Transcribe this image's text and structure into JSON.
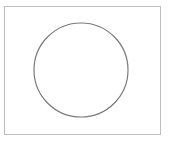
{
  "diagram": {
    "frame": {
      "border_color": "#bdbdbd"
    },
    "circle": {
      "cx": 81,
      "cy": 70,
      "r": 47,
      "stroke": "#7a7a7a",
      "stroke_width": 1.2,
      "fill": "none"
    }
  }
}
